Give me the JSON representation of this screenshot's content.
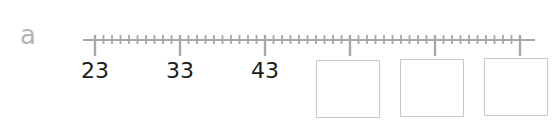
{
  "exercise": {
    "label": "a",
    "number_line": {
      "start": 23,
      "major_step": 10,
      "minor_divisions": 10,
      "major_ticks": [
        {
          "value": "23",
          "shown": true
        },
        {
          "value": "33",
          "shown": true
        },
        {
          "value": "43",
          "shown": true
        },
        {
          "value": "",
          "shown": false
        },
        {
          "value": "",
          "shown": false
        },
        {
          "value": "",
          "shown": false
        }
      ]
    },
    "answer_boxes": [
      "",
      "",
      ""
    ],
    "colors": {
      "line": "#a8a8a8",
      "label": "#b3b3b3",
      "text": "#1a1a1a",
      "box_border": "#c8c8c8"
    }
  }
}
